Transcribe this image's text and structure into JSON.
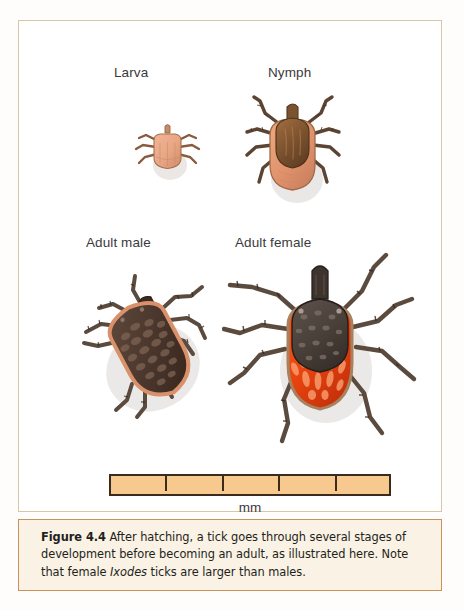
{
  "figure": {
    "frame_border_color": "#d8c6a8",
    "canvas_color": "#ffffff",
    "stages": [
      {
        "id": "larva",
        "label": "Larva"
      },
      {
        "id": "nymph",
        "label": "Nymph"
      },
      {
        "id": "adult_male",
        "label": "Adult male"
      },
      {
        "id": "adult_female",
        "label": "Adult female"
      }
    ],
    "scale": {
      "unit_label": "mm",
      "segments": 5,
      "tick_count": 4,
      "fill_color": "#f7c98e",
      "border_color": "#3a2b1c"
    },
    "caption": {
      "figure_number": "Figure 4.4",
      "text_part_1": "  After hatching, a tick goes through several stages of development before becoming an adult, as illustrated here. Note that female ",
      "scientific_name": "Ixodes",
      "text_part_2": " ticks are larger than males.",
      "background_color": "#faf2e4",
      "border_color": "#c8935a"
    },
    "art_colors": {
      "larva_body": "#e8a583",
      "nymph_scutum": "#8a5a33",
      "nymph_body": "#e09a73",
      "adult_male_body": "#4a3a30",
      "adult_male_rim": "#d8916a",
      "adult_female_scutum": "#4a3f38",
      "adult_female_abdomen": "#e8430f",
      "leg_color": "#5b4a3e"
    }
  }
}
